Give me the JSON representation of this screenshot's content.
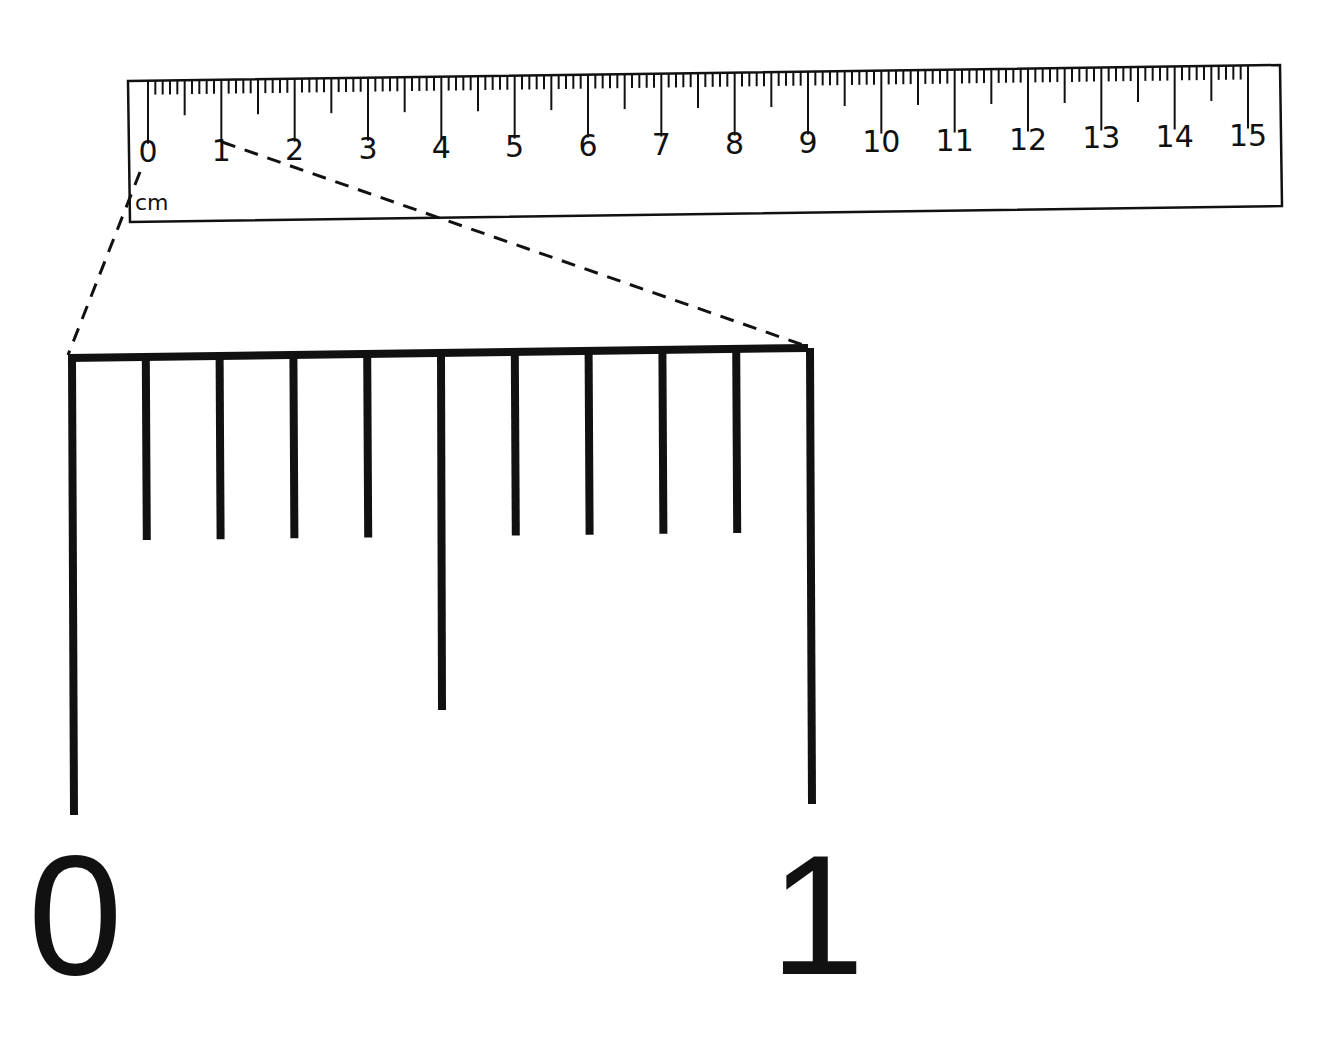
{
  "ruler": {
    "unit_label": "cm",
    "major_labels": [
      "0",
      "1",
      "2",
      "3",
      "4",
      "5",
      "6",
      "7",
      "8",
      "9",
      "10",
      "11",
      "12",
      "13",
      "14",
      "15"
    ],
    "range_cm": [
      0,
      15
    ],
    "minor_division": "1 mm"
  },
  "magnified": {
    "description": "Enlarged view of the 0-1 cm section showing millimetre divisions",
    "start_label": "0",
    "end_label": "1",
    "tick_count": 11,
    "half_mark_index": 5
  },
  "colors": {
    "ink": "#111111",
    "background": "#ffffff"
  }
}
